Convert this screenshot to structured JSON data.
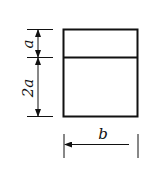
{
  "diagram": {
    "type": "dimensioned-rectangle",
    "labels": {
      "top_height": "a",
      "bottom_height": "2a",
      "width": "b"
    },
    "colors": {
      "stroke": "#111111",
      "background": "#ffffff"
    }
  }
}
